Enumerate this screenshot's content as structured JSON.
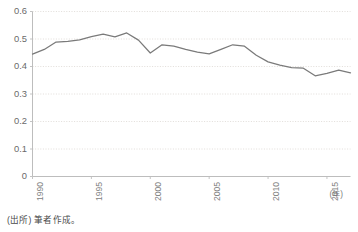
{
  "chart_data": {
    "type": "line",
    "title": "",
    "xlabel": "(年)",
    "ylabel": "",
    "ylim": [
      0,
      0.6
    ],
    "xlim": [
      1990,
      2017
    ],
    "grid": true,
    "legend": false,
    "y_ticks": [
      "0.6",
      "0.5",
      "0.4",
      "0.3",
      "0.2",
      "0.1",
      "0"
    ],
    "y_tick_values": [
      0.6,
      0.5,
      0.4,
      0.3,
      0.2,
      0.1,
      0
    ],
    "x_ticks": [
      "1990",
      "1995",
      "2000",
      "2005",
      "2010",
      "2015"
    ],
    "x_tick_values": [
      1990,
      1995,
      2000,
      2005,
      2010,
      2015
    ],
    "x": [
      1990,
      1991,
      1992,
      1993,
      1994,
      1995,
      1996,
      1997,
      1998,
      1999,
      2000,
      2001,
      2002,
      2003,
      2004,
      2005,
      2006,
      2007,
      2008,
      2009,
      2010,
      2011,
      2012,
      2013,
      2014,
      2015,
      2016,
      2017
    ],
    "values": [
      0.445,
      0.462,
      0.489,
      0.491,
      0.497,
      0.509,
      0.518,
      0.508,
      0.522,
      0.496,
      0.449,
      0.479,
      0.474,
      0.462,
      0.452,
      0.446,
      0.462,
      0.479,
      0.474,
      0.441,
      0.417,
      0.405,
      0.396,
      0.394,
      0.366,
      0.375,
      0.387,
      0.377
    ],
    "series_color": "#7a7a7a",
    "grid_color": "#d9d4cf",
    "axis_color": "#bdbdbd"
  },
  "footer": {
    "source_note": "(出所) 筆者作成。"
  },
  "axis_unit": "(年)"
}
